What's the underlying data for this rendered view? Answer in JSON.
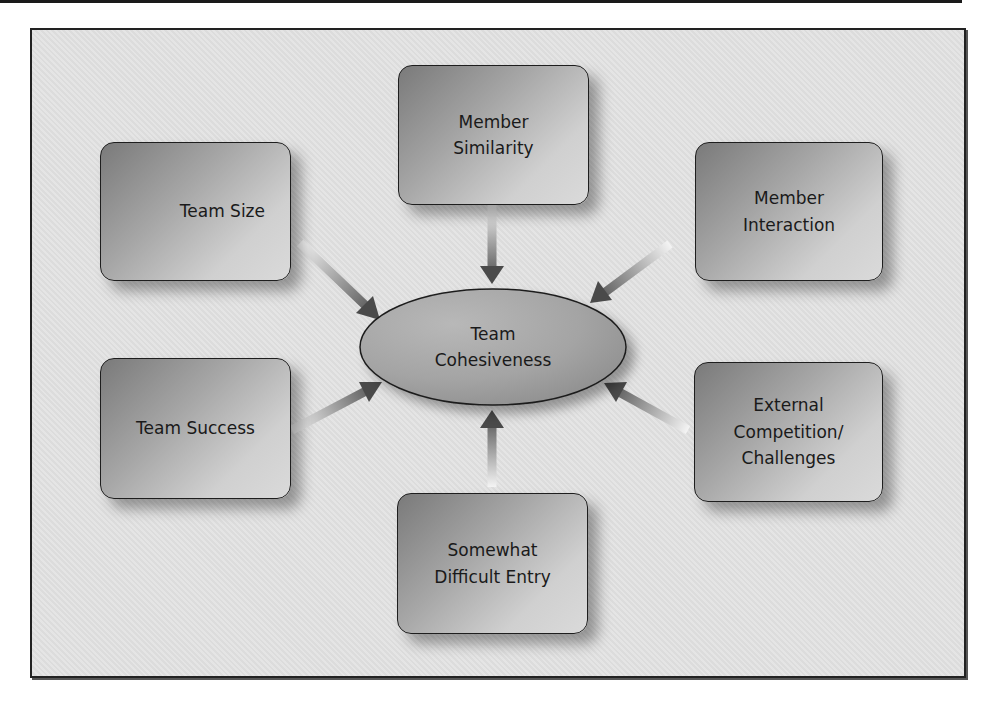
{
  "diagram": {
    "type": "hub-and-spoke",
    "center": {
      "label": "Team\nCohesiveness"
    },
    "factors": [
      {
        "id": "team-size",
        "label": "Team Size"
      },
      {
        "id": "member-similarity",
        "label": "Member\nSimilarity"
      },
      {
        "id": "member-interaction",
        "label": "Member\nInteraction"
      },
      {
        "id": "team-success",
        "label": "Team Success"
      },
      {
        "id": "external-competition",
        "label": "External\nCompetition/\nChallenges"
      },
      {
        "id": "difficult-entry",
        "label": "Somewhat\nDifficult Entry"
      }
    ],
    "arrows": [
      {
        "from": "Team Size",
        "to": "Team Cohesiveness"
      },
      {
        "from": "Member Similarity",
        "to": "Team Cohesiveness"
      },
      {
        "from": "Member Interaction",
        "to": "Team Cohesiveness"
      },
      {
        "from": "Team Success",
        "to": "Team Cohesiveness"
      },
      {
        "from": "External Competition/Challenges",
        "to": "Team Cohesiveness"
      },
      {
        "from": "Somewhat Difficult Entry",
        "to": "Team Cohesiveness"
      }
    ],
    "colors": {
      "frame_bg": "#e3e3e3",
      "box_dark": "#7a7a7a",
      "box_light": "#dadada",
      "ellipse_fill": "#a9a9a9",
      "arrow_dark": "#4a4a4a",
      "arrow_light": "#f0f0f0",
      "border": "#1e1e1e"
    }
  }
}
